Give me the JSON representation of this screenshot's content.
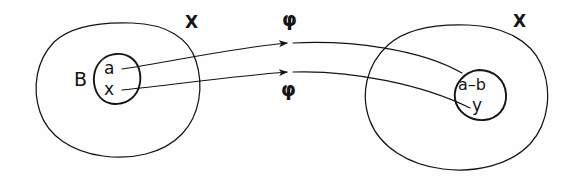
{
  "figure": {
    "title": "",
    "ink_color": "#141414",
    "background_color": "#fefefe",
    "style": "hand-drawn mathematical set diagram"
  },
  "sets": {
    "left": {
      "outer_label": "X",
      "inner_label": "B",
      "inner_elements": {
        "top": "a",
        "bottom": "x"
      }
    },
    "right": {
      "outer_label": "X",
      "inner_label": "",
      "inner_elements": {
        "top": "a–b",
        "bottom": "y"
      }
    }
  },
  "arrows": {
    "top": {
      "label": "φ",
      "direction": "left-to-right"
    },
    "bottom": {
      "label": "φ",
      "direction": "left-to-right"
    }
  }
}
